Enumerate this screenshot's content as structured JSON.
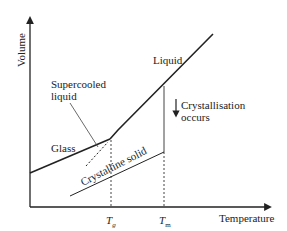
{
  "diagram": {
    "type": "volume-temperature diagram",
    "axes": {
      "y_label": "Volume",
      "x_label": "Temperature"
    },
    "ticks": {
      "tg": {
        "symbol": "T",
        "subscript": "g"
      },
      "tm": {
        "symbol": "T",
        "subscript": "m"
      }
    },
    "labels": {
      "liquid": "Liquid",
      "supercooled_line1": "Supercooled",
      "supercooled_line2": "liquid",
      "glass": "Glass",
      "crystalline": "Crystalline solid",
      "crystallisation_line1": "Crystallisation",
      "crystallisation_line2": "occurs"
    },
    "colors": {
      "line": "#222222",
      "background": "#ffffff"
    }
  }
}
